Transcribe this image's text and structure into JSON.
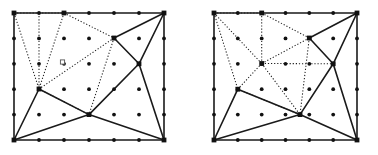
{
  "figure": {
    "type": "mesh-diagram",
    "panels": [
      {
        "name": "left-panel",
        "label": "",
        "rect": {
          "x0": 14,
          "y0": 13,
          "x1": 164,
          "y1": 140
        },
        "grid": {
          "cols": 7,
          "rows": 6,
          "xs": [
            14,
            39,
            64,
            89,
            114,
            139,
            164
          ],
          "ys": [
            13,
            38.4,
            63.8,
            89.2,
            114.6,
            140
          ]
        },
        "interior_grid_points": [
          [
            39,
            38.4
          ],
          [
            64,
            38.4
          ],
          [
            89,
            38.4
          ],
          [
            114,
            38.4
          ],
          [
            139,
            38.4
          ],
          [
            39,
            63.8
          ],
          [
            64,
            63.8
          ],
          [
            89,
            63.8
          ],
          [
            114,
            63.8
          ],
          [
            139,
            63.8
          ],
          [
            39,
            89.2
          ],
          [
            64,
            89.2
          ],
          [
            89,
            89.2
          ],
          [
            114,
            89.2
          ],
          [
            139,
            89.2
          ],
          [
            39,
            114.6
          ],
          [
            64,
            114.6
          ],
          [
            89,
            114.6
          ],
          [
            114,
            114.6
          ],
          [
            139,
            114.6
          ]
        ],
        "boundary_grid_points": [
          [
            14,
            13
          ],
          [
            39,
            13
          ],
          [
            64,
            13
          ],
          [
            89,
            13
          ],
          [
            114,
            13
          ],
          [
            139,
            13
          ],
          [
            164,
            13
          ],
          [
            14,
            38.4
          ],
          [
            164,
            38.4
          ],
          [
            14,
            63.8
          ],
          [
            164,
            63.8
          ],
          [
            14,
            89.2
          ],
          [
            164,
            89.2
          ],
          [
            14,
            114.6
          ],
          [
            164,
            114.6
          ],
          [
            14,
            140
          ],
          [
            39,
            140
          ],
          [
            64,
            140
          ],
          [
            89,
            140
          ],
          [
            114,
            140
          ],
          [
            139,
            140
          ],
          [
            164,
            140
          ]
        ],
        "mesh_vertices": [
          [
            14,
            13
          ],
          [
            64,
            13
          ],
          [
            164,
            13
          ],
          [
            114,
            38.0
          ],
          [
            39,
            89.0
          ],
          [
            139,
            63.8
          ],
          [
            89,
            114.6
          ],
          [
            14,
            140
          ],
          [
            164,
            140
          ]
        ],
        "solid_edges": [
          [
            [
              14,
              13
            ],
            [
              164,
              13
            ]
          ],
          [
            [
              164,
              13
            ],
            [
              164,
              140
            ]
          ],
          [
            [
              164,
              140
            ],
            [
              14,
              140
            ]
          ],
          [
            [
              14,
              140
            ],
            [
              14,
              13
            ]
          ],
          [
            [
              164,
              13
            ],
            [
              114,
              38.0
            ]
          ],
          [
            [
              114,
              38.0
            ],
            [
              139,
              63.8
            ]
          ],
          [
            [
              139,
              63.8
            ],
            [
              164,
              13
            ]
          ],
          [
            [
              139,
              63.8
            ],
            [
              164,
              140
            ]
          ],
          [
            [
              139,
              63.8
            ],
            [
              89,
              114.6
            ]
          ],
          [
            [
              89,
              114.6
            ],
            [
              164,
              140
            ]
          ],
          [
            [
              89,
              114.6
            ],
            [
              14,
              140
            ]
          ],
          [
            [
              39,
              89.0
            ],
            [
              14,
              140
            ]
          ],
          [
            [
              39,
              89.0
            ],
            [
              89,
              114.6
            ]
          ]
        ],
        "dotted_edges": [
          [
            [
              14,
              13
            ],
            [
              39,
              13
            ]
          ],
          [
            [
              39,
              13
            ],
            [
              64,
              13
            ]
          ],
          [
            [
              14,
              13
            ],
            [
              39,
              89.0
            ]
          ],
          [
            [
              39,
              13
            ],
            [
              39,
              89.0
            ]
          ],
          [
            [
              64,
              13
            ],
            [
              39,
              89.0
            ]
          ],
          [
            [
              64,
              13
            ],
            [
              114,
              38.0
            ]
          ],
          [
            [
              114,
              38.0
            ],
            [
              39,
              89.0
            ]
          ],
          [
            [
              39,
              89.0
            ],
            [
              89,
              114.6
            ]
          ],
          [
            [
              114,
              38.0
            ],
            [
              89,
              114.6
            ]
          ]
        ],
        "hollow_marker": {
          "x": 62.5,
          "y": 62.0,
          "size": 4.2
        }
      },
      {
        "name": "right-panel",
        "label": "",
        "rect": {
          "x0": 214,
          "y0": 13,
          "x1": 357,
          "y1": 140
        },
        "grid": {
          "cols": 7,
          "rows": 6,
          "xs": [
            214,
            237.8,
            261.7,
            285.5,
            309.3,
            333.2,
            357
          ],
          "ys": [
            13,
            38.4,
            63.8,
            89.2,
            114.6,
            140
          ]
        },
        "interior_grid_points": [
          [
            237.8,
            38.4
          ],
          [
            261.7,
            38.4
          ],
          [
            285.5,
            38.4
          ],
          [
            309.3,
            38.4
          ],
          [
            333.2,
            38.4
          ],
          [
            237.8,
            63.8
          ],
          [
            261.7,
            63.8
          ],
          [
            285.5,
            63.8
          ],
          [
            309.3,
            63.8
          ],
          [
            333.2,
            63.8
          ],
          [
            237.8,
            89.2
          ],
          [
            261.7,
            89.2
          ],
          [
            285.5,
            89.2
          ],
          [
            309.3,
            89.2
          ],
          [
            333.2,
            89.2
          ],
          [
            237.8,
            114.6
          ],
          [
            261.7,
            114.6
          ],
          [
            285.5,
            114.6
          ],
          [
            309.3,
            114.6
          ],
          [
            333.2,
            114.6
          ]
        ],
        "boundary_grid_points": [
          [
            214,
            13
          ],
          [
            237.8,
            13
          ],
          [
            261.7,
            13
          ],
          [
            285.5,
            13
          ],
          [
            309.3,
            13
          ],
          [
            333.2,
            13
          ],
          [
            357,
            13
          ],
          [
            214,
            38.4
          ],
          [
            357,
            38.4
          ],
          [
            214,
            63.8
          ],
          [
            357,
            63.8
          ],
          [
            214,
            89.2
          ],
          [
            357,
            89.2
          ],
          [
            214,
            114.6
          ],
          [
            357,
            114.6
          ],
          [
            214,
            140
          ],
          [
            237.8,
            140
          ],
          [
            261.7,
            140
          ],
          [
            285.5,
            140
          ],
          [
            309.3,
            140
          ],
          [
            333.2,
            140
          ],
          [
            357,
            140
          ]
        ],
        "mesh_vertices": [
          [
            214,
            13
          ],
          [
            261.7,
            13
          ],
          [
            357,
            13
          ],
          [
            309.3,
            38.0
          ],
          [
            261.7,
            63.5
          ],
          [
            237.8,
            89.2
          ],
          [
            333.2,
            63.8
          ],
          [
            300.0,
            114.6
          ],
          [
            214,
            140
          ],
          [
            357,
            140
          ]
        ],
        "solid_edges": [
          [
            [
              214,
              13
            ],
            [
              357,
              13
            ]
          ],
          [
            [
              357,
              13
            ],
            [
              357,
              140
            ]
          ],
          [
            [
              357,
              140
            ],
            [
              214,
              140
            ]
          ],
          [
            [
              214,
              140
            ],
            [
              214,
              13
            ]
          ],
          [
            [
              357,
              13
            ],
            [
              309.3,
              38.0
            ]
          ],
          [
            [
              309.3,
              38.0
            ],
            [
              333.2,
              63.8
            ]
          ],
          [
            [
              333.2,
              63.8
            ],
            [
              357,
              13
            ]
          ],
          [
            [
              333.2,
              63.8
            ],
            [
              357,
              140
            ]
          ],
          [
            [
              333.2,
              63.8
            ],
            [
              300.0,
              114.6
            ]
          ],
          [
            [
              300.0,
              114.6
            ],
            [
              357,
              140
            ]
          ],
          [
            [
              300.0,
              114.6
            ],
            [
              214,
              140
            ]
          ],
          [
            [
              237.8,
              89.2
            ],
            [
              214,
              140
            ]
          ],
          [
            [
              237.8,
              89.2
            ],
            [
              300.0,
              114.6
            ]
          ]
        ],
        "dotted_edges": [
          [
            [
              214,
              13
            ],
            [
              237.8,
              13
            ]
          ],
          [
            [
              237.8,
              13
            ],
            [
              261.7,
              13
            ]
          ],
          [
            [
              214,
              13
            ],
            [
              237.8,
              89.2
            ]
          ],
          [
            [
              214,
              13
            ],
            [
              261.7,
              63.5
            ]
          ],
          [
            [
              261.7,
              13
            ],
            [
              261.7,
              63.5
            ]
          ],
          [
            [
              261.7,
              13
            ],
            [
              309.3,
              38.0
            ]
          ],
          [
            [
              309.3,
              38.0
            ],
            [
              261.7,
              63.5
            ]
          ],
          [
            [
              261.7,
              63.5
            ],
            [
              237.8,
              89.2
            ]
          ],
          [
            [
              261.7,
              63.5
            ],
            [
              300.0,
              114.6
            ]
          ],
          [
            [
              261.7,
              63.5
            ],
            [
              333.2,
              63.8
            ]
          ],
          [
            [
              237.8,
              89.2
            ],
            [
              300.0,
              114.6
            ]
          ],
          [
            [
              309.3,
              38.0
            ],
            [
              300.0,
              114.6
            ]
          ]
        ],
        "hollow_marker": null
      }
    ],
    "style": {
      "line_color": "#1a1a1a",
      "point_color": "#111111",
      "background": "#ffffff",
      "solid_width": 1.6,
      "dotted_width": 1.05,
      "grid_point_radius": 1.9,
      "vertex_half_size": 2.4
    }
  }
}
